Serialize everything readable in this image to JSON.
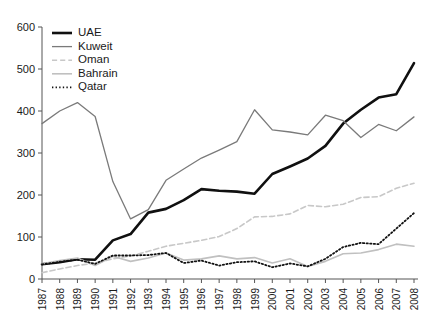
{
  "chart_data": {
    "type": "line",
    "title": "",
    "subtitle": "",
    "xlabel": "",
    "ylabel": "",
    "xlim": [
      1987,
      2008
    ],
    "ylim": [
      0,
      600
    ],
    "ytick_step": 100,
    "grid": false,
    "legend_position": "top-left",
    "categories": [
      "1987",
      "1988",
      "1989",
      "1990",
      "1991",
      "1992",
      "1993",
      "1994",
      "1995",
      "1996",
      "1997",
      "1998",
      "1999",
      "2000",
      "2001",
      "2002",
      "2003",
      "2004",
      "2005",
      "2006",
      "2007",
      "2008"
    ],
    "yticks": [
      "0",
      "100",
      "200",
      "300",
      "400",
      "500",
      "600"
    ],
    "series": [
      {
        "name": "UAE",
        "color": "#101010",
        "style": "solid",
        "width": 2.6,
        "values": [
          35,
          40,
          47,
          46,
          92,
          107,
          158,
          167,
          188,
          214,
          210,
          208,
          203,
          250,
          268,
          287,
          317,
          370,
          403,
          432,
          440,
          514
        ]
      },
      {
        "name": "Kuweit",
        "color": "#7a7a7a",
        "style": "solid",
        "width": 1.3,
        "values": [
          370,
          400,
          420,
          387,
          232,
          143,
          165,
          235,
          262,
          288,
          307,
          327,
          403,
          355,
          350,
          343,
          390,
          377,
          337,
          368,
          353,
          386
        ]
      },
      {
        "name": "Oman",
        "color": "#c8c8c8",
        "style": "dashed",
        "width": 1.6,
        "values": [
          15,
          24,
          32,
          38,
          48,
          55,
          66,
          78,
          85,
          92,
          101,
          120,
          148,
          149,
          155,
          175,
          172,
          178,
          194,
          196,
          216,
          228
        ]
      },
      {
        "name": "Bahrain",
        "color": "#c0c0c0",
        "style": "solid",
        "width": 1.6,
        "values": [
          36,
          44,
          50,
          32,
          54,
          42,
          50,
          62,
          45,
          48,
          55,
          48,
          51,
          38,
          48,
          30,
          42,
          60,
          62,
          70,
          83,
          78
        ]
      },
      {
        "name": "Qatar",
        "color": "#111111",
        "style": "dotted",
        "width": 1.8,
        "values": [
          35,
          41,
          46,
          36,
          56,
          56,
          57,
          62,
          38,
          44,
          32,
          40,
          42,
          28,
          37,
          30,
          48,
          76,
          86,
          83,
          120,
          157
        ]
      }
    ]
  },
  "legend": {
    "items": [
      {
        "label": "UAE"
      },
      {
        "label": "Kuweit"
      },
      {
        "label": "Oman"
      },
      {
        "label": "Bahrain"
      },
      {
        "label": "Qatar"
      }
    ]
  }
}
